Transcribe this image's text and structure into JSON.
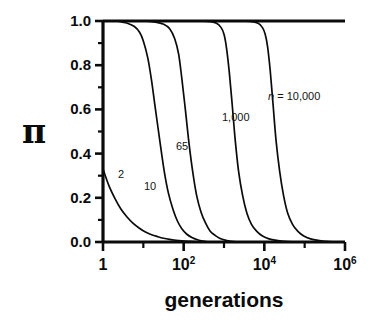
{
  "figure": {
    "background": "#ffffff",
    "ink_color": "#0b0b0b"
  },
  "axes": {
    "y_label": "π",
    "x_label": "generations",
    "y_tick_labels": [
      "1.0",
      "0.8",
      "0.6",
      "0.4",
      "0.2",
      "0.0"
    ],
    "x_tick_labels": [
      {
        "mantissa": "1",
        "exponent": ""
      },
      {
        "mantissa": "10",
        "exponent": "2"
      },
      {
        "mantissa": "10",
        "exponent": "4"
      },
      {
        "mantissa": "10",
        "exponent": "6"
      }
    ]
  },
  "curve_labels": [
    {
      "text": "2",
      "x": 118,
      "y": 168
    },
    {
      "text": "10",
      "x": 144,
      "y": 180
    },
    {
      "text": "65",
      "x": 176,
      "y": 140
    },
    {
      "text": "1,000",
      "x": 222,
      "y": 111
    },
    {
      "text": "n",
      "suffix": " = 10,000",
      "x": 268,
      "y": 90
    }
  ],
  "caption": "",
  "chart_data": {
    "type": "line",
    "title": "",
    "xlabel": "generations",
    "ylabel": "π",
    "xscale": "log",
    "xlim": [
      1,
      1000000
    ],
    "ylim": [
      0.0,
      1.0
    ],
    "grid": false,
    "legend": "inline-curve-labels",
    "x_ticks": [
      1,
      100,
      10000,
      1000000
    ],
    "x_tick_text": [
      "1",
      "10^2",
      "10^4",
      "10^6"
    ],
    "x_minor_ticks": [
      10,
      1000,
      100000
    ],
    "y_ticks": [
      0.0,
      0.2,
      0.4,
      0.6,
      0.8,
      1.0
    ],
    "y_minor_ticks": [
      0.1,
      0.3,
      0.5,
      0.7,
      0.9
    ],
    "series": [
      {
        "name": "n = 2",
        "label": "2",
        "start_value": 0.33,
        "half_life_generations": 2.0,
        "x": [
          1,
          1.4,
          2,
          2.8,
          4,
          5.6,
          8,
          11,
          16,
          23,
          32,
          45,
          64,
          90,
          128,
          180,
          256
        ],
        "values": [
          0.33,
          0.255,
          0.195,
          0.148,
          0.112,
          0.084,
          0.062,
          0.046,
          0.033,
          0.024,
          0.017,
          0.012,
          0.008,
          0.005,
          0.003,
          0.002,
          0.0
        ]
      },
      {
        "name": "n = 10",
        "label": "10",
        "start_value": 1.0,
        "midpoint_generations": 14,
        "x": [
          1,
          2,
          3,
          4,
          6,
          8,
          10,
          13,
          16,
          20,
          26,
          33,
          42,
          55,
          70,
          90,
          120,
          160,
          220,
          300,
          420
        ],
        "values": [
          1.0,
          1.0,
          0.995,
          0.99,
          0.975,
          0.95,
          0.91,
          0.83,
          0.73,
          0.6,
          0.45,
          0.32,
          0.22,
          0.145,
          0.095,
          0.06,
          0.035,
          0.02,
          0.01,
          0.004,
          0.0
        ]
      },
      {
        "name": "n = 65",
        "label": "65",
        "start_value": 1.0,
        "midpoint_generations": 90,
        "x": [
          1,
          4,
          10,
          20,
          32,
          45,
          60,
          75,
          90,
          110,
          135,
          170,
          210,
          270,
          350,
          450,
          600,
          800,
          1100,
          1500,
          2200
        ],
        "values": [
          1.0,
          1.0,
          1.0,
          0.995,
          0.985,
          0.965,
          0.92,
          0.85,
          0.74,
          0.6,
          0.45,
          0.31,
          0.21,
          0.135,
          0.085,
          0.05,
          0.03,
          0.016,
          0.008,
          0.003,
          0.0
        ]
      },
      {
        "name": "n = 1,000",
        "label": "1,000",
        "start_value": 1.0,
        "midpoint_generations": 1400,
        "x": [
          1,
          50,
          200,
          400,
          650,
          850,
          1000,
          1150,
          1350,
          1600,
          1900,
          2300,
          2900,
          3700,
          4800,
          6500,
          9000,
          13000,
          20000,
          32000,
          55000
        ],
        "values": [
          1.0,
          1.0,
          1.0,
          0.998,
          0.99,
          0.97,
          0.94,
          0.88,
          0.77,
          0.62,
          0.46,
          0.32,
          0.21,
          0.13,
          0.08,
          0.048,
          0.027,
          0.014,
          0.007,
          0.003,
          0.0
        ]
      },
      {
        "name": "n = 10,000",
        "label": "n = 10,000",
        "start_value": 1.0,
        "midpoint_generations": 14000,
        "x": [
          1,
          500,
          2000,
          4500,
          7000,
          9000,
          10500,
          12000,
          14000,
          16500,
          19500,
          24000,
          30000,
          38000,
          50000,
          68000,
          95000,
          140000,
          215000,
          340000,
          560000
        ],
        "values": [
          1.0,
          1.0,
          1.0,
          0.998,
          0.99,
          0.97,
          0.94,
          0.885,
          0.775,
          0.62,
          0.46,
          0.32,
          0.21,
          0.13,
          0.08,
          0.048,
          0.027,
          0.014,
          0.007,
          0.003,
          0.0
        ]
      }
    ]
  }
}
